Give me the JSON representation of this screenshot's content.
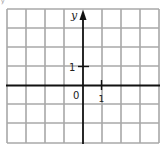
{
  "diagram": {
    "type": "coordinate-grid",
    "grid": {
      "columns": 8,
      "rows": 7,
      "x_start": 7,
      "y_start": 9,
      "cell_size": 19.1,
      "line_color": "#a8a8a8"
    },
    "axes": {
      "color": "#111111",
      "y_axis_label": "y",
      "origin_label": "0",
      "x_axis_has_arrow": false,
      "y_axis_has_arrow": true
    },
    "ticks": {
      "y_tick_label": "1",
      "x_tick_label": "1"
    },
    "corner_fragment": "y"
  }
}
